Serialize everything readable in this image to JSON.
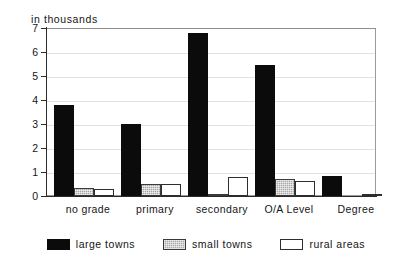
{
  "chart_data": {
    "type": "bar",
    "title": "",
    "unit_caption": "in thousands",
    "xlabel": "",
    "ylabel": "",
    "ylim": [
      0,
      7
    ],
    "yticks": [
      0,
      1,
      2,
      3,
      4,
      5,
      6,
      7
    ],
    "ytick_labels": [
      "0",
      "1",
      "2",
      "3",
      "4",
      "5",
      "6",
      "7"
    ],
    "grid": true,
    "legend_position": "bottom",
    "categories": [
      "no grade",
      "primary",
      "secondary",
      "O/A Level",
      "Degree"
    ],
    "series": [
      {
        "name": "large towns",
        "color": "#0b0b0b",
        "values": [
          3.8,
          3.0,
          6.8,
          5.45,
          0.85
        ]
      },
      {
        "name": "small towns",
        "color": "#a8a8a8",
        "values": [
          0.35,
          0.5,
          0.1,
          0.7,
          0.0
        ]
      },
      {
        "name": "rural areas",
        "color": "#ffffff",
        "values": [
          0.28,
          0.52,
          0.78,
          0.63,
          0.05
        ]
      }
    ]
  },
  "legend": {
    "items": [
      {
        "label": "large towns",
        "swatch": "black-solid-swatch"
      },
      {
        "label": "small towns",
        "swatch": "gray-hatched-swatch"
      },
      {
        "label": "rural areas",
        "swatch": "white-outline-swatch"
      }
    ]
  }
}
